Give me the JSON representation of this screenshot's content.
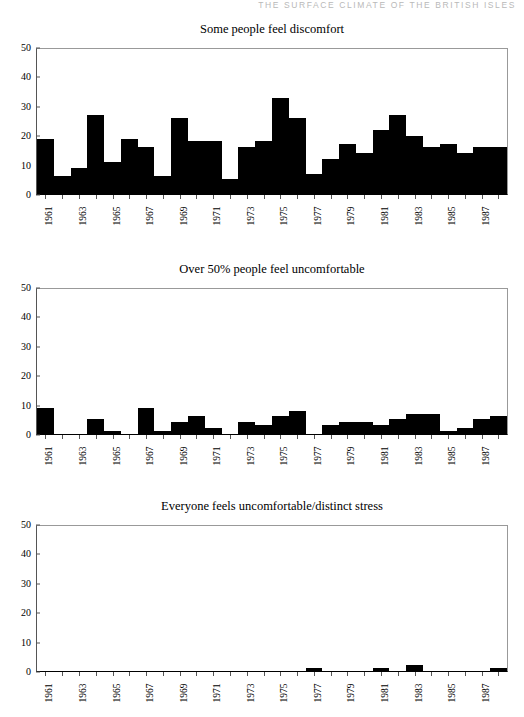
{
  "running_head": "THE SURFACE CLIMATE OF THE BRITISH ISLES",
  "page": {
    "background": "#ffffff",
    "bar_color": "#000000",
    "axis_color": "#555555"
  },
  "chart_data": [
    {
      "type": "bar",
      "title": "Some people feel discomfort",
      "xlabel": "",
      "ylabel": "",
      "ylim": [
        0,
        50
      ],
      "yticks": [
        0,
        10,
        20,
        30,
        40,
        50
      ],
      "grid": false,
      "legend": "none",
      "categories": [
        "1961",
        "1962",
        "1963",
        "1964",
        "1965",
        "1966",
        "1967",
        "1968",
        "1969",
        "1970",
        "1971",
        "1972",
        "1973",
        "1974",
        "1975",
        "1976",
        "1977",
        "1978",
        "1979",
        "1980",
        "1981",
        "1982",
        "1983",
        "1984",
        "1985",
        "1986",
        "1987",
        "1988"
      ],
      "tick_labels": [
        "1961",
        "",
        "1963",
        "",
        "1965",
        "",
        "1967",
        "",
        "1969",
        "",
        "1971",
        "",
        "1973",
        "",
        "1975",
        "",
        "1977",
        "",
        "1979",
        "",
        "1981",
        "",
        "1983",
        "",
        "1985",
        "",
        "1987",
        ""
      ],
      "values": [
        19,
        6,
        9,
        27,
        11,
        19,
        16,
        6,
        26,
        18,
        18,
        5,
        16,
        18,
        33,
        26,
        7,
        12,
        17,
        14,
        22,
        27,
        20,
        16,
        17,
        14,
        16,
        16
      ]
    },
    {
      "type": "bar",
      "title": "Over 50% people feel uncomfortable",
      "xlabel": "",
      "ylabel": "",
      "ylim": [
        0,
        50
      ],
      "yticks": [
        0,
        10,
        20,
        30,
        40,
        50
      ],
      "grid": false,
      "legend": "none",
      "categories": [
        "1961",
        "1962",
        "1963",
        "1964",
        "1965",
        "1966",
        "1967",
        "1968",
        "1969",
        "1970",
        "1971",
        "1972",
        "1973",
        "1974",
        "1975",
        "1976",
        "1977",
        "1978",
        "1979",
        "1980",
        "1981",
        "1982",
        "1983",
        "1984",
        "1985",
        "1986",
        "1987",
        "1988"
      ],
      "tick_labels": [
        "1961",
        "",
        "1963",
        "",
        "1965",
        "",
        "1967",
        "",
        "1969",
        "",
        "1971",
        "",
        "1973",
        "",
        "1975",
        "",
        "1977",
        "",
        "1979",
        "",
        "1981",
        "",
        "1983",
        "",
        "1985",
        "",
        "1987",
        ""
      ],
      "values": [
        9,
        0,
        0,
        5,
        1,
        0,
        9,
        1,
        4,
        6,
        2,
        0,
        4,
        3,
        6,
        8,
        0,
        3,
        4,
        4,
        3,
        5,
        7,
        7,
        1,
        2,
        5,
        6
      ]
    },
    {
      "type": "bar",
      "title": "Everyone feels uncomfortable/distinct stress",
      "xlabel": "",
      "ylabel": "",
      "ylim": [
        0,
        50
      ],
      "yticks": [
        0,
        10,
        20,
        30,
        40,
        50
      ],
      "grid": false,
      "legend": "none",
      "categories": [
        "1961",
        "1962",
        "1963",
        "1964",
        "1965",
        "1966",
        "1967",
        "1968",
        "1969",
        "1970",
        "1971",
        "1972",
        "1973",
        "1974",
        "1975",
        "1976",
        "1977",
        "1978",
        "1979",
        "1980",
        "1981",
        "1982",
        "1983",
        "1984",
        "1985",
        "1986",
        "1987",
        "1988"
      ],
      "tick_labels": [
        "1961",
        "",
        "1963",
        "",
        "1965",
        "",
        "1967",
        "",
        "1969",
        "",
        "1971",
        "",
        "1973",
        "",
        "1975",
        "",
        "1977",
        "",
        "1979",
        "",
        "1981",
        "",
        "1983",
        "",
        "1985",
        "",
        "1987",
        ""
      ],
      "values": [
        0,
        0,
        0,
        0,
        0,
        0,
        0,
        0,
        0,
        0,
        0,
        0,
        0,
        0,
        0,
        0,
        1,
        0,
        0,
        0,
        1,
        0,
        2,
        0,
        0,
        0,
        0,
        1
      ]
    }
  ]
}
